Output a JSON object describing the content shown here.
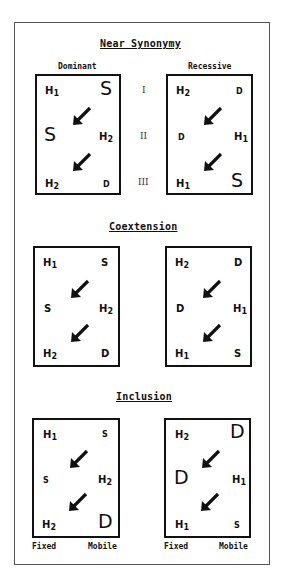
{
  "sections": [
    {
      "title": "Near Synonymy",
      "column_labels": [
        "Dominant",
        "Recessive"
      ],
      "row_numerals": [
        "I",
        "II",
        "III"
      ],
      "left_box": {
        "row1": {
          "left": "H",
          "left_sub": "1",
          "right": "S"
        },
        "row2": {
          "left": "S",
          "right": "H",
          "right_sub": "2"
        },
        "row3": {
          "left": "H",
          "left_sub": "2",
          "right": "D"
        }
      },
      "right_box": {
        "row1": {
          "left": "H",
          "left_sub": "2",
          "right": "D"
        },
        "row2": {
          "left": "D",
          "right": "H",
          "right_sub": "1"
        },
        "row3": {
          "left": "H",
          "left_sub": "1",
          "right": "S"
        }
      }
    },
    {
      "title": "Coextension",
      "left_box": {
        "row1": {
          "left": "H",
          "left_sub": "1",
          "right": "S"
        },
        "row2": {
          "left": "S",
          "right": "H",
          "right_sub": "2"
        },
        "row3": {
          "left": "H",
          "left_sub": "2",
          "right": "D"
        }
      },
      "right_box": {
        "row1": {
          "left": "H",
          "left_sub": "2",
          "right": "D"
        },
        "row2": {
          "left": "D",
          "right": "H",
          "right_sub": "1"
        },
        "row3": {
          "left": "H",
          "left_sub": "1",
          "right": "S"
        }
      }
    },
    {
      "title": "Inclusion",
      "left_box": {
        "row1": {
          "left": "H",
          "left_sub": "1",
          "right": "S"
        },
        "row2": {
          "left": "S",
          "right": "H",
          "right_sub": "2"
        },
        "row3": {
          "left": "H",
          "left_sub": "2",
          "right": "D"
        }
      },
      "right_box": {
        "row1": {
          "left": "H",
          "left_sub": "2",
          "right": "D"
        },
        "row2": {
          "left": "D",
          "right": "H",
          "right_sub": "1"
        },
        "row3": {
          "left": "H",
          "left_sub": "1",
          "right": "S"
        }
      },
      "footer_labels": [
        "Fixed",
        "Mobile"
      ]
    }
  ],
  "arrow_icon": "diagonal-arrow-down-left"
}
